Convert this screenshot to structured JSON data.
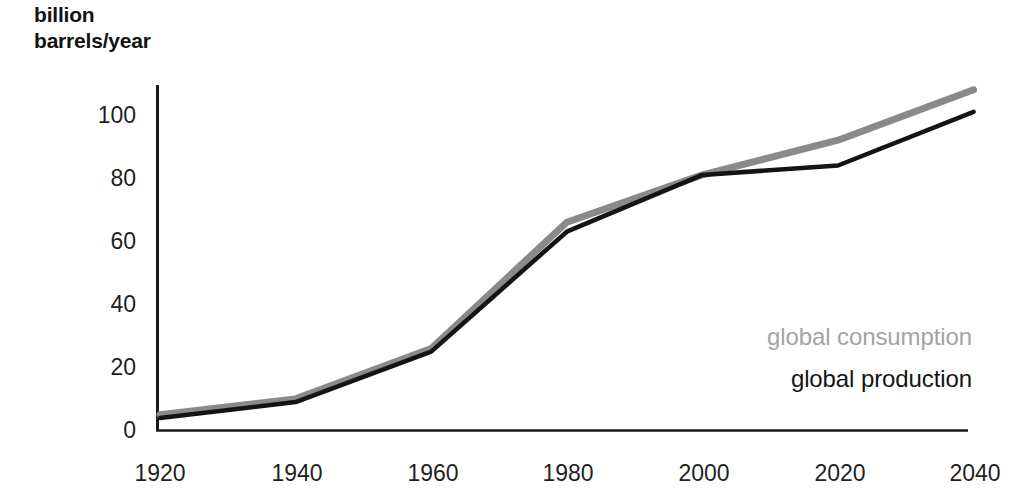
{
  "figure": {
    "y_axis_caption": "billion\nbarrels/year",
    "legend": [
      {
        "name": "legend-consumption",
        "label": "global consumption",
        "color": "#a3a3a3"
      },
      {
        "name": "legend-production",
        "label": "global production",
        "color": "#141414"
      }
    ]
  },
  "chart_data": {
    "type": "line",
    "title": "",
    "subtitle": "",
    "xlabel": "",
    "ylabel": "billion barrels/year",
    "x": [
      1920,
      1940,
      1960,
      1980,
      2000,
      2020,
      2040
    ],
    "categories": [
      "1920",
      "1940",
      "1960",
      "1980",
      "2000",
      "2020",
      "2040"
    ],
    "xticks": [
      "1920",
      "1940",
      "1960",
      "1980",
      "2000",
      "2020",
      "2040"
    ],
    "yticks": [
      "0",
      "20",
      "40",
      "60",
      "80",
      "100"
    ],
    "ytick_values": [
      0,
      20,
      40,
      60,
      80,
      100
    ],
    "xlim": [
      1920,
      2040
    ],
    "ylim": [
      0,
      112
    ],
    "grid": false,
    "legend_position": "inside-right",
    "series": [
      {
        "name": "global consumption",
        "color": "#8a8a8a",
        "values": [
          5,
          10,
          26,
          66,
          81,
          92,
          108
        ]
      },
      {
        "name": "global production",
        "color": "#141414",
        "values": [
          4,
          9,
          25,
          63,
          81,
          84,
          101
        ]
      }
    ]
  }
}
